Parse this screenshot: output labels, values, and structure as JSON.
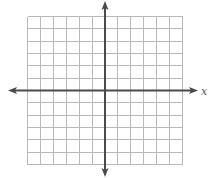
{
  "chart_data": {
    "type": "coordinate-grid",
    "title": "",
    "xlabel": "x",
    "ylabel": "",
    "xlim": [
      -6,
      6
    ],
    "ylim": [
      -6,
      6
    ],
    "grid": true,
    "grid_step": 1,
    "x_ticks_labeled": false,
    "y_ticks_labeled": false,
    "axes_arrows": [
      "left",
      "right",
      "up",
      "down"
    ]
  },
  "colors": {
    "grid": "#b8b8b8",
    "axis": "#4a4a4a",
    "label": "#555555"
  }
}
